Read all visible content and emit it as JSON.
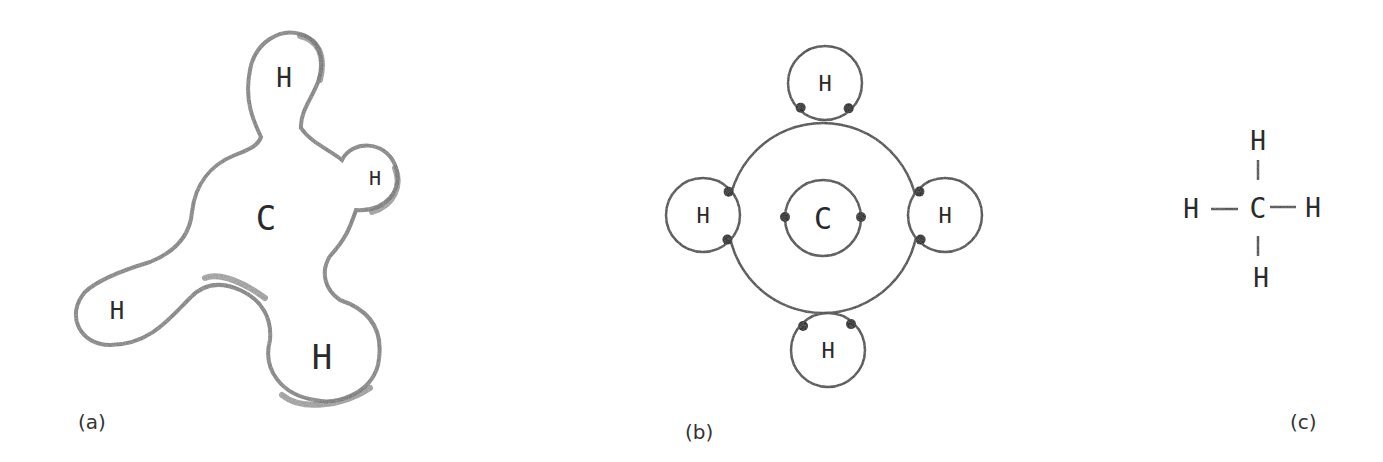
{
  "diagram": {
    "panels": [
      {
        "id": "a",
        "label": "(a)",
        "description": "Electron cloud / space-filling outline",
        "label_pos": [
          92,
          440
        ],
        "atoms": [
          {
            "symbol": "C",
            "x": 266,
            "y": 218,
            "size": 34
          },
          {
            "symbol": "H",
            "x": 284,
            "y": 78,
            "size": 26
          },
          {
            "symbol": "H",
            "x": 375,
            "y": 178,
            "size": 20
          },
          {
            "symbol": "H",
            "x": 117,
            "y": 311,
            "size": 24
          },
          {
            "symbol": "H",
            "x": 322,
            "y": 357,
            "size": 34
          }
        ]
      },
      {
        "id": "b",
        "label": "(b)",
        "description": "Bohr-style shell diagram with shared electron pairs",
        "label_pos": [
          700,
          440
        ],
        "center": [
          823,
          218
        ],
        "outer_shell_r": 95,
        "inner_shell_r": 38,
        "atoms": [
          {
            "symbol": "C",
            "x": 823,
            "y": 218,
            "size": 30
          },
          {
            "symbol": "H",
            "x": 825,
            "y": 83,
            "size": 22,
            "r": 37
          },
          {
            "symbol": "H",
            "x": 703,
            "y": 215,
            "size": 22,
            "r": 37
          },
          {
            "symbol": "H",
            "x": 945,
            "y": 215,
            "size": 22,
            "r": 37
          },
          {
            "symbol": "H",
            "x": 828,
            "y": 350,
            "size": 22,
            "r": 37
          }
        ]
      },
      {
        "id": "c",
        "label": "(c)",
        "description": "Structural formula",
        "label_pos": [
          1307,
          440
        ],
        "formula": {
          "center": "C",
          "top": "H",
          "left": "H",
          "right": "H",
          "bottom": "H"
        }
      }
    ]
  }
}
